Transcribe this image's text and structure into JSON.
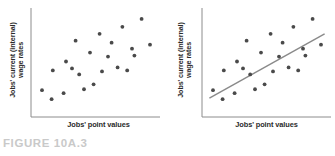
{
  "figure": {
    "caption": "FIGURE 10A.3",
    "caption_color": "#c9c9c9",
    "background": "#ffffff"
  },
  "style": {
    "dot_color": "#4a4a4a",
    "axis_color": "#8c8c8c",
    "trendline_color": "#8a8a8a",
    "label_color": "#2b2b2b"
  },
  "chart_data": [
    {
      "type": "scatter",
      "title": "",
      "panel": "left",
      "xlabel": "Jobs' point values",
      "ylabel_line1": "Jobs' current (internal)",
      "ylabel_line2": "wage rates",
      "xlim": [
        0,
        100
      ],
      "ylim": [
        0,
        100
      ],
      "grid": false,
      "legend": "none",
      "trendline": false,
      "points": [
        {
          "x": 5,
          "y": 22
        },
        {
          "x": 13,
          "y": 13
        },
        {
          "x": 14,
          "y": 42
        },
        {
          "x": 23,
          "y": 19
        },
        {
          "x": 25,
          "y": 51
        },
        {
          "x": 30,
          "y": 44
        },
        {
          "x": 33,
          "y": 72
        },
        {
          "x": 36,
          "y": 38
        },
        {
          "x": 40,
          "y": 23
        },
        {
          "x": 45,
          "y": 60
        },
        {
          "x": 48,
          "y": 28
        },
        {
          "x": 53,
          "y": 79
        },
        {
          "x": 55,
          "y": 41
        },
        {
          "x": 60,
          "y": 56
        },
        {
          "x": 63,
          "y": 70
        },
        {
          "x": 68,
          "y": 45
        },
        {
          "x": 72,
          "y": 86
        },
        {
          "x": 76,
          "y": 42
        },
        {
          "x": 80,
          "y": 64
        },
        {
          "x": 82,
          "y": 57
        },
        {
          "x": 88,
          "y": 94
        },
        {
          "x": 95,
          "y": 68
        }
      ]
    },
    {
      "type": "scatter",
      "title": "",
      "panel": "right",
      "xlabel": "Jobs' point values",
      "ylabel_line1": "Jobs' current (internal)",
      "ylabel_line2": "wage rates",
      "xlim": [
        0,
        100
      ],
      "ylim": [
        0,
        100
      ],
      "grid": false,
      "legend": "none",
      "trendline": true,
      "trendline_points": [
        {
          "x": 2,
          "y": 14
        },
        {
          "x": 98,
          "y": 79
        }
      ],
      "points": [
        {
          "x": 5,
          "y": 22
        },
        {
          "x": 13,
          "y": 13
        },
        {
          "x": 14,
          "y": 42
        },
        {
          "x": 23,
          "y": 19
        },
        {
          "x": 25,
          "y": 51
        },
        {
          "x": 30,
          "y": 44
        },
        {
          "x": 33,
          "y": 72
        },
        {
          "x": 36,
          "y": 38
        },
        {
          "x": 40,
          "y": 23
        },
        {
          "x": 45,
          "y": 60
        },
        {
          "x": 48,
          "y": 28
        },
        {
          "x": 53,
          "y": 79
        },
        {
          "x": 55,
          "y": 41
        },
        {
          "x": 60,
          "y": 56
        },
        {
          "x": 63,
          "y": 70
        },
        {
          "x": 68,
          "y": 45
        },
        {
          "x": 72,
          "y": 86
        },
        {
          "x": 76,
          "y": 42
        },
        {
          "x": 80,
          "y": 64
        },
        {
          "x": 82,
          "y": 57
        },
        {
          "x": 88,
          "y": 94
        },
        {
          "x": 95,
          "y": 68
        }
      ]
    }
  ]
}
